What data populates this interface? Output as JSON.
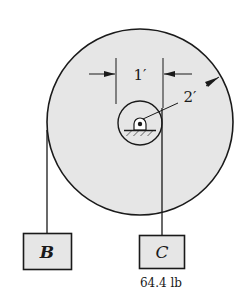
{
  "diagram": {
    "type": "pulley-system",
    "colors": {
      "fill": "#e6e6e6",
      "stroke": "#1a1a1a",
      "background": "#ffffff"
    },
    "wheel": {
      "outer_radius_label": "2′",
      "hub_spacing_label": "1′"
    },
    "blocks": [
      {
        "id": "B",
        "label": "B",
        "weight": ""
      },
      {
        "id": "C",
        "label": "C",
        "weight": "64.4 lb"
      }
    ]
  }
}
